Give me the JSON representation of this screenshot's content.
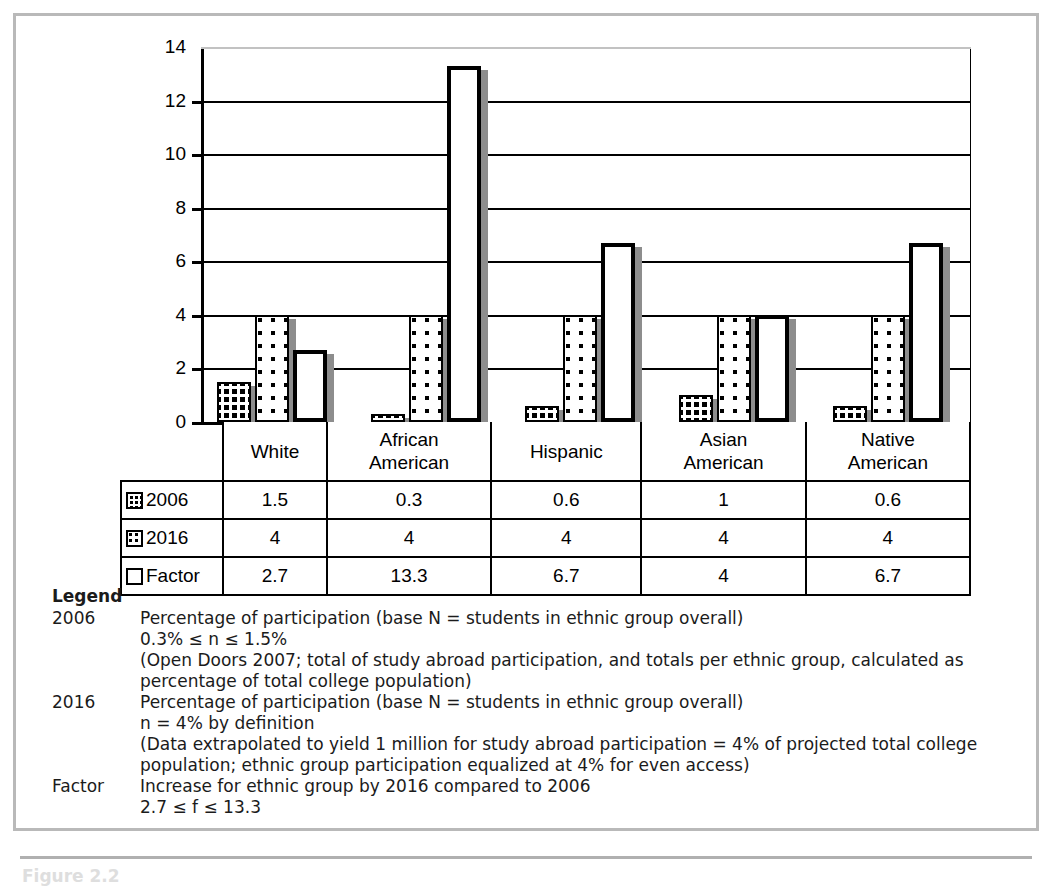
{
  "chart_data": {
    "type": "bar",
    "title": "",
    "xlabel": "",
    "ylabel": "",
    "ylim": [
      0,
      14
    ],
    "yticks": [
      0,
      2,
      4,
      6,
      8,
      10,
      12,
      14
    ],
    "grid": true,
    "legend_position": "table-below",
    "categories": [
      "White",
      "African American",
      "Hispanic",
      "Asian American",
      "Native American"
    ],
    "series": [
      {
        "name": "2006",
        "values": [
          1.5,
          0.3,
          0.6,
          1,
          0.6
        ],
        "swatch": "dark-dotted-swatch"
      },
      {
        "name": "2016",
        "values": [
          4,
          4,
          4,
          4,
          4
        ],
        "swatch": "light-dotted-swatch"
      },
      {
        "name": "Factor",
        "values": [
          2.7,
          13.3,
          6.7,
          4,
          6.7
        ],
        "swatch": "outline-swatch"
      }
    ]
  },
  "table": {
    "category_labels": [
      [
        "White"
      ],
      [
        "African",
        "American"
      ],
      [
        "Hispanic"
      ],
      [
        "Asian",
        "American"
      ],
      [
        "Native",
        "American"
      ]
    ],
    "rows": [
      {
        "key": "2006",
        "values": [
          "1.5",
          "0.3",
          "0.6",
          "1",
          "0.6"
        ]
      },
      {
        "key": "2016",
        "values": [
          "4",
          "4",
          "4",
          "4",
          "4"
        ]
      },
      {
        "key": "Factor",
        "values": [
          "2.7",
          "13.3",
          "6.7",
          "4",
          "6.7"
        ]
      }
    ]
  },
  "legend": {
    "title": "Legend",
    "entries": [
      {
        "key": "2006",
        "lines": [
          "Percentage of participation (base N = students in ethnic group overall)",
          "0.3% ≤ n ≤ 1.5%",
          "(Open Doors 2007; total of study abroad participation, and totals per ethnic group, calculated as\npercentage of total college population)"
        ]
      },
      {
        "key": "2016",
        "lines": [
          "Percentage of participation (base N = students in ethnic group overall)",
          "n = 4% by definition",
          "(Data extrapolated to yield 1 million for study abroad participation = 4% of projected total college\npopulation; ethnic group participation equalized at 4% for even access)"
        ]
      },
      {
        "key": "Factor",
        "lines": [
          "Increase for ethnic group by 2016 compared to 2006",
          "2.7 ≤ f ≤ 13.3"
        ]
      }
    ]
  },
  "caption": "Figure 2.2",
  "colors": {
    "frame": "#b9b9b9",
    "ink": "#000000",
    "shadow": "#8d8d8d",
    "legend_text": "#1b1b1b"
  }
}
